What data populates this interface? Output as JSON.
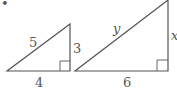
{
  "diagram": {
    "bullet": "•",
    "triangles": [
      {
        "name": "small-triangle",
        "hypotenuse": "5",
        "vertical_leg": "3",
        "horizontal_leg": "4",
        "right_angle": true
      },
      {
        "name": "large-triangle",
        "hypotenuse": "y",
        "vertical_leg": "x",
        "horizontal_leg": "6",
        "right_angle": true
      }
    ],
    "colors": {
      "stroke": "#555555",
      "text": "#555555"
    }
  }
}
